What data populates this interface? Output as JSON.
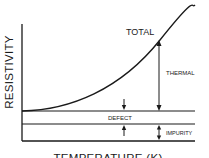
{
  "diagram": {
    "y_axis_label": "RESISTIVITY",
    "x_axis_label": "TEMPERATURE (K)",
    "curve_label": "TOTAL",
    "components": {
      "thermal": "THERMAL",
      "defect": "DEFECT",
      "impurity": "IMPURITY"
    },
    "colors": {
      "ink": "#1a1a1a",
      "background": "#ffffff"
    }
  }
}
